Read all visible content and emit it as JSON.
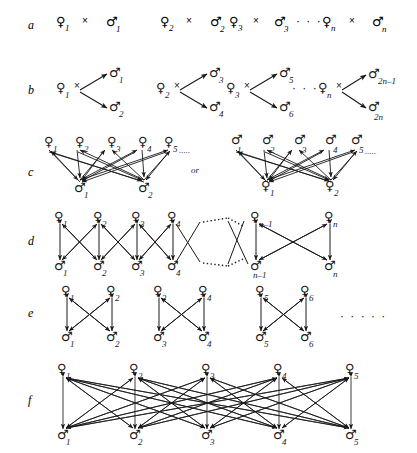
{
  "figure": {
    "background": "#ffffff",
    "ink": "#1a1a1a",
    "width": 417,
    "height": 453,
    "symbols": {
      "female": "♀",
      "male": "♂",
      "cross": "×",
      "ellipsis_inline": "⋯",
      "ellipsis_dots": "· · · · ·"
    },
    "row_labels": [
      "a",
      "b",
      "c",
      "d",
      "e",
      "f"
    ],
    "or_label": "or"
  },
  "rows": {
    "a": {
      "label": "a",
      "y": 25,
      "pairs": [
        {
          "female": "♀",
          "fsub": "1",
          "cross": "×",
          "male": "♂",
          "msub": "1"
        },
        {
          "female": "♀",
          "fsub": "2",
          "cross": "×",
          "male": "♂",
          "msub": "2"
        },
        {
          "female": "♀",
          "fsub": "3",
          "cross": "×",
          "male": "♂",
          "msub": "3"
        },
        {
          "female": "♀",
          "fsub": "n",
          "cross": "×",
          "male": "♂",
          "msub": "n"
        }
      ],
      "ellipsis": "· · ·"
    },
    "b": {
      "label": "b",
      "y": 90,
      "groups": [
        {
          "female": "♀",
          "fsub": "1",
          "cross": "×",
          "males": [
            {
              "sym": "♂",
              "sub": "1"
            },
            {
              "sym": "♂",
              "sub": "2"
            }
          ]
        },
        {
          "female": "♀",
          "fsub": "2",
          "cross": "×",
          "males": [
            {
              "sym": "♂",
              "sub": "3"
            },
            {
              "sym": "♂",
              "sub": "4"
            }
          ]
        },
        {
          "female": "♀",
          "fsub": "3",
          "cross": "×",
          "males": [
            {
              "sym": "♂",
              "sub": "5"
            },
            {
              "sym": "♂",
              "sub": "6"
            }
          ]
        },
        {
          "female": "♀",
          "fsub": "n",
          "cross": "×",
          "males": [
            {
              "sym": "♂",
              "sub": "2n–1"
            },
            {
              "sym": "♂",
              "sub": "2n"
            }
          ]
        }
      ],
      "ellipsis": "· · ·"
    },
    "c": {
      "label": "c",
      "y": 170,
      "or_label": "or",
      "left": {
        "top": [
          {
            "sym": "♀",
            "sub": "1"
          },
          {
            "sym": "♀",
            "sub": "2"
          },
          {
            "sym": "♀",
            "sub": "3"
          },
          {
            "sym": "♀",
            "sub": "4"
          },
          {
            "sym": "♀",
            "sub": "5"
          }
        ],
        "top_ellipsis": ".....",
        "bottom": [
          {
            "sym": "♂",
            "sub": "1"
          },
          {
            "sym": "♂",
            "sub": "2"
          }
        ]
      },
      "right": {
        "top": [
          {
            "sym": "♂",
            "sub": "1"
          },
          {
            "sym": "♂",
            "sub": "2"
          },
          {
            "sym": "♂",
            "sub": "3"
          },
          {
            "sym": "♂",
            "sub": "4"
          },
          {
            "sym": "♂",
            "sub": "5"
          }
        ],
        "top_ellipsis": ".....",
        "bottom": [
          {
            "sym": "♀",
            "sub": "1"
          },
          {
            "sym": "♀",
            "sub": "2"
          }
        ]
      }
    },
    "d": {
      "label": "d",
      "y": 240,
      "top": [
        {
          "sym": "♀",
          "sub": "1"
        },
        {
          "sym": "♀",
          "sub": "2"
        },
        {
          "sym": "♀",
          "sub": "3"
        },
        {
          "sym": "♀",
          "sub": "4"
        },
        {
          "sym": "♀",
          "sub": "n–1"
        },
        {
          "sym": "♀",
          "sub": "n"
        }
      ],
      "bottom": [
        {
          "sym": "♂",
          "sub": "1"
        },
        {
          "sym": "♂",
          "sub": "2"
        },
        {
          "sym": "♂",
          "sub": "3"
        },
        {
          "sym": "♂",
          "sub": "4"
        },
        {
          "sym": "♂",
          "sub": "n–1"
        },
        {
          "sym": "♂",
          "sub": "n"
        }
      ]
    },
    "e": {
      "label": "e",
      "y": 312,
      "groups": [
        {
          "top": [
            {
              "sym": "♀",
              "sub": "1"
            },
            {
              "sym": "♀",
              "sub": "2"
            }
          ],
          "bottom": [
            {
              "sym": "♂",
              "sub": "1"
            },
            {
              "sym": "♂",
              "sub": "2"
            }
          ]
        },
        {
          "top": [
            {
              "sym": "♀",
              "sub": "3"
            },
            {
              "sym": "♀",
              "sub": "4"
            }
          ],
          "bottom": [
            {
              "sym": "♂",
              "sub": "3"
            },
            {
              "sym": "♂",
              "sub": "4"
            }
          ]
        },
        {
          "top": [
            {
              "sym": "♀",
              "sub": "5"
            },
            {
              "sym": "♀",
              "sub": "6"
            }
          ],
          "bottom": [
            {
              "sym": "♂",
              "sub": "5"
            },
            {
              "sym": "♂",
              "sub": "6"
            }
          ]
        }
      ],
      "ellipsis": "· · · · ·"
    },
    "f": {
      "label": "f",
      "y": 400,
      "top": [
        {
          "sym": "♀",
          "sub": "1"
        },
        {
          "sym": "♀",
          "sub": "2"
        },
        {
          "sym": "♀",
          "sub": "3"
        },
        {
          "sym": "♀",
          "sub": "4"
        },
        {
          "sym": "♀",
          "sub": "5"
        }
      ],
      "bottom": [
        {
          "sym": "♂",
          "sub": "1"
        },
        {
          "sym": "♂",
          "sub": "2"
        },
        {
          "sym": "♂",
          "sub": "3"
        },
        {
          "sym": "♂",
          "sub": "4"
        },
        {
          "sym": "♂",
          "sub": "5"
        }
      ]
    }
  }
}
